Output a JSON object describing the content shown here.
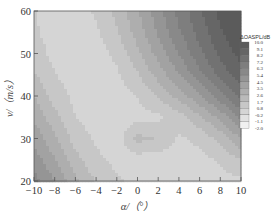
{
  "chart_data": {
    "type": "heatmap",
    "subtype": "filled-contour",
    "title": "",
    "xlabel": "α/（°）",
    "ylabel": "v/（m/s）",
    "xlim": [
      -10,
      10
    ],
    "ylim": [
      20,
      60
    ],
    "x_ticks": [
      "-10",
      "-8",
      "-6",
      "-4",
      "-2",
      "0",
      "2",
      "4",
      "6",
      "8",
      "10"
    ],
    "y_ticks": [
      "20",
      "30",
      "40",
      "50",
      "60"
    ],
    "colormap": "gray (dark = high, light = low)",
    "legend": {
      "title": "ΔOASPL/dB",
      "position": "right",
      "levels": [
        "10.0",
        "9.1",
        "8.2",
        "7.2",
        "6.3",
        "5.4",
        "4.5",
        "3.5",
        "2.6",
        "1.7",
        "0.8",
        "-0.2",
        "-1.1",
        "-2.0"
      ]
    },
    "x": [
      -10,
      -8,
      -6,
      -4,
      -2,
      0,
      2,
      4,
      6,
      8,
      10
    ],
    "y": [
      20,
      25,
      30,
      35,
      40,
      45,
      50,
      55,
      60
    ],
    "z": [
      [
        5.8,
        4.5,
        2.8,
        1.6,
        0.9,
        0.6,
        0.4,
        0.3,
        0.3,
        0.4,
        0.6
      ],
      [
        5.0,
        3.6,
        2.0,
        1.0,
        0.5,
        0.3,
        0.3,
        0.3,
        0.5,
        0.9,
        1.6
      ],
      [
        4.2,
        2.8,
        1.3,
        0.6,
        0.3,
        2.0,
        1.6,
        0.6,
        1.0,
        2.0,
        3.6
      ],
      [
        3.4,
        2.0,
        0.8,
        0.3,
        0.2,
        0.4,
        0.6,
        1.2,
        2.4,
        3.8,
        5.6
      ],
      [
        2.6,
        1.3,
        0.5,
        0.2,
        0.3,
        0.8,
        1.8,
        3.0,
        4.4,
        6.0,
        7.6
      ],
      [
        1.8,
        0.8,
        0.3,
        0.2,
        0.6,
        1.6,
        3.0,
        4.4,
        6.0,
        7.6,
        8.8
      ],
      [
        1.2,
        0.5,
        0.2,
        0.3,
        1.0,
        2.4,
        3.9,
        5.4,
        7.0,
        8.4,
        9.4
      ],
      [
        0.9,
        0.4,
        0.2,
        0.6,
        1.6,
        3.0,
        4.6,
        6.2,
        7.6,
        9.0,
        9.8
      ],
      [
        0.8,
        0.4,
        0.3,
        0.9,
        2.0,
        3.4,
        5.0,
        6.6,
        8.0,
        9.3,
        10.0
      ]
    ],
    "grid": false
  }
}
